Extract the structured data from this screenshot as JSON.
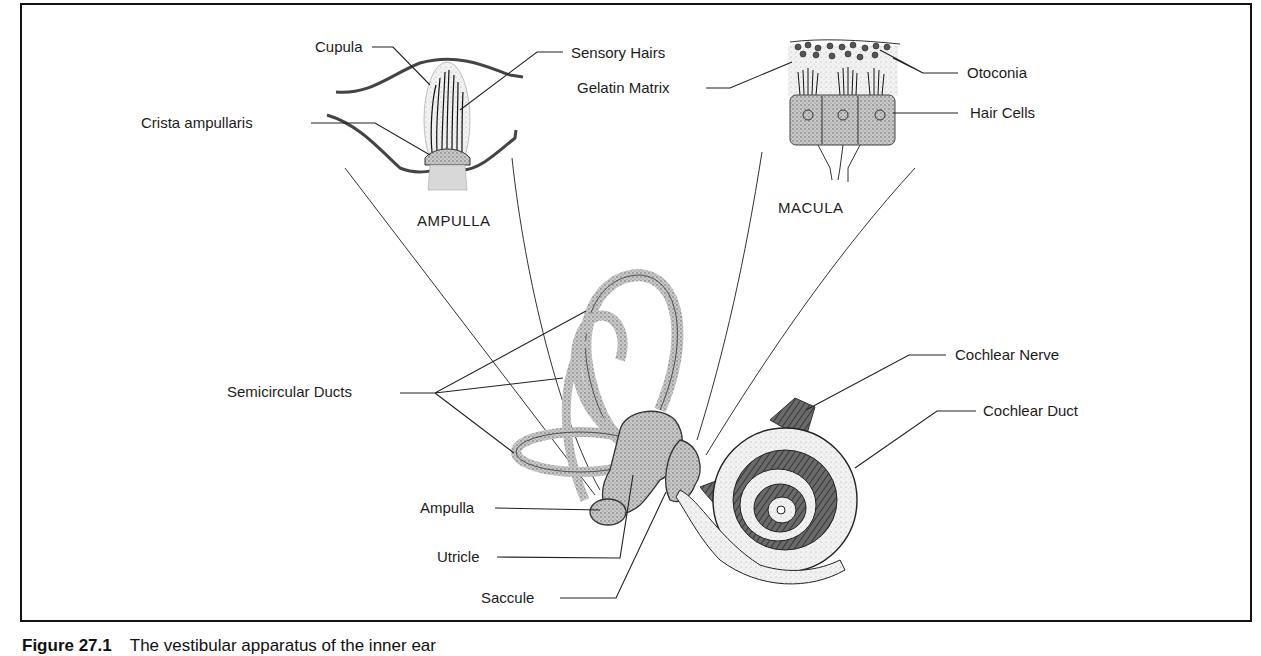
{
  "figure": {
    "caption_number": "Figure 27.1",
    "caption_text": "The vestibular apparatus of the inner ear"
  },
  "sections": {
    "ampulla_detail": "AMPULLA",
    "macula_detail": "MACULA"
  },
  "labels": {
    "cupula": "Cupula",
    "sensory_hairs": "Sensory Hairs",
    "crista_ampullaris": "Crista ampullaris",
    "gelatin_matrix": "Gelatin Matrix",
    "otoconia": "Otoconia",
    "hair_cells": "Hair Cells",
    "semicircular_ducts": "Semicircular Ducts",
    "cochlear_nerve": "Cochlear Nerve",
    "cochlear_duct": "Cochlear Duct",
    "ampulla": "Ampulla",
    "utricle": "Utricle",
    "saccule": "Saccule"
  }
}
